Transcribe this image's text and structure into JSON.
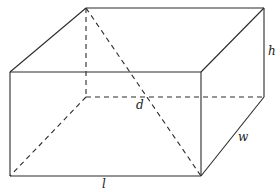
{
  "diagram": {
    "type": "rectangular-prism",
    "labels": {
      "length": "l",
      "width": "w",
      "height": "h",
      "diagonal": "d"
    },
    "colors": {
      "line": "#2a2a2a",
      "background": "#ffffff",
      "text": "#222222"
    },
    "vertices": {
      "front_top_left": [
        10,
        72
      ],
      "front_top_right": [
        201,
        72
      ],
      "front_bottom_left": [
        10,
        176
      ],
      "front_bottom_right": [
        201,
        176
      ],
      "back_top_left": [
        86,
        8
      ],
      "back_top_right": [
        264,
        8
      ],
      "back_bottom_left": [
        86,
        97
      ],
      "back_bottom_right": [
        264,
        97
      ]
    },
    "visible_edges": [
      [
        "front_top_left",
        "front_top_right"
      ],
      [
        "front_top_right",
        "front_bottom_right"
      ],
      [
        "front_bottom_right",
        "front_bottom_left"
      ],
      [
        "front_bottom_left",
        "front_top_left"
      ],
      [
        "front_top_left",
        "back_top_left"
      ],
      [
        "back_top_left",
        "back_top_right"
      ],
      [
        "back_top_right",
        "front_top_right"
      ],
      [
        "back_top_right",
        "back_bottom_right"
      ],
      [
        "back_bottom_right",
        "front_bottom_right"
      ]
    ],
    "hidden_edges": [
      [
        "back_top_left",
        "back_bottom_left"
      ],
      [
        "back_bottom_left",
        "back_bottom_right"
      ],
      [
        "back_bottom_left",
        "front_bottom_left"
      ]
    ],
    "diagonal": [
      "back_top_left",
      "front_bottom_right"
    ]
  }
}
